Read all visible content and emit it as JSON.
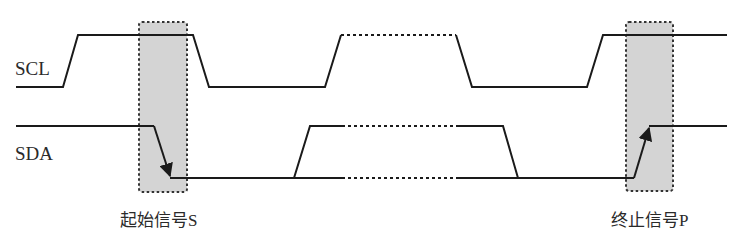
{
  "diagram": {
    "type": "timing-diagram",
    "colors": {
      "line": "#1a1a1a",
      "box_fill": "#d4d4d4",
      "box_border": "#333333",
      "text": "#2a2a2a"
    },
    "signals": [
      {
        "name": "SCL",
        "label_pos": [
          15,
          75
        ],
        "solid_segments": [
          [
            [
              16,
              87
            ],
            [
              63,
              87
            ],
            [
              78,
              35
            ],
            [
              193,
              35
            ],
            [
              209,
              87
            ],
            [
              325,
              87
            ],
            [
              341,
              35
            ]
          ],
          [
            [
              456,
              35
            ],
            [
              472,
              87
            ],
            [
              587,
              87
            ],
            [
              603,
              35
            ],
            [
              727,
              35
            ]
          ]
        ],
        "dashed_segments": [
          [
            [
              341,
              35
            ],
            [
              456,
              35
            ]
          ]
        ]
      },
      {
        "name": "SDA",
        "label_pos": [
          15,
          160
        ],
        "solid_segments": [
          [
            [
              16,
              126
            ],
            [
              154,
              126
            ],
            [
              168,
              176
            ]
          ],
          [
            [
              170,
              178
            ],
            [
              342,
              178
            ]
          ],
          [
            [
              294,
              178
            ],
            [
              310,
              126
            ],
            [
              342,
              126
            ]
          ],
          [
            [
              456,
              126
            ],
            [
              503,
              126
            ],
            [
              518,
              178
            ]
          ],
          [
            [
              456,
              178
            ],
            [
              634,
              178
            ],
            [
              647,
              130
            ]
          ],
          [
            [
              649,
              126
            ],
            [
              727,
              126
            ]
          ]
        ],
        "dashed_segments": [
          [
            [
              342,
              126
            ],
            [
              456,
              126
            ]
          ],
          [
            [
              342,
              178
            ],
            [
              456,
              178
            ]
          ]
        ]
      }
    ],
    "highlight_boxes": [
      {
        "name": "start-condition-box",
        "x": 139,
        "y": 22,
        "w": 48,
        "h": 170
      },
      {
        "name": "stop-condition-box",
        "x": 626,
        "y": 22,
        "w": 47,
        "h": 169
      }
    ],
    "arrows": [
      {
        "name": "sda-falling-arrow",
        "from": [
          154,
          126
        ],
        "to": [
          171,
          178
        ]
      },
      {
        "name": "sda-rising-arrow",
        "from": [
          634,
          178
        ],
        "to": [
          650,
          126
        ]
      }
    ],
    "captions": [
      {
        "text": "起始信号S",
        "x": 120,
        "y": 226
      },
      {
        "text": "终止信号P",
        "x": 611,
        "y": 226
      }
    ]
  },
  "labels": {
    "scl": "SCL",
    "sda": "SDA",
    "start": "起始信号S",
    "stop": "终止信号P"
  }
}
